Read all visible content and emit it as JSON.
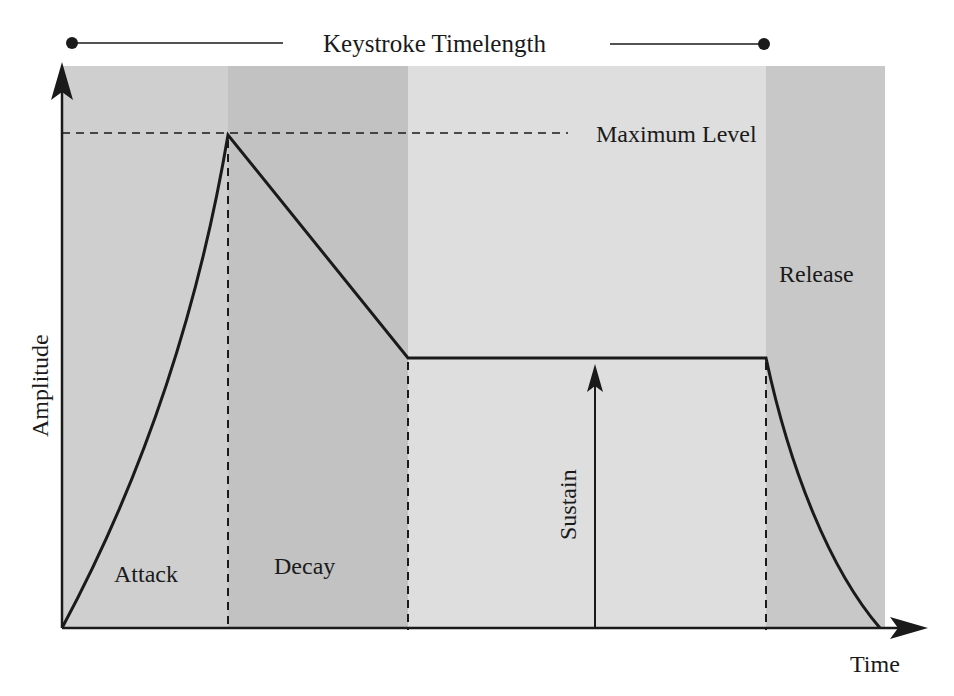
{
  "diagram": {
    "type": "ADSR envelope",
    "title": "Keystroke Timelength",
    "axes": {
      "x_label": "Time",
      "y_label": "Amplitude"
    },
    "annotations": {
      "max_level": "Maximum Level",
      "sustain": "Sustain"
    },
    "phases": [
      {
        "name": "Attack",
        "label": "Attack",
        "shade": "#cfcfcf"
      },
      {
        "name": "Decay",
        "label": "Decay",
        "shade": "#c2c2c2"
      },
      {
        "name": "Sustain",
        "label": "Sustain",
        "shade": "#dedede"
      },
      {
        "name": "Release",
        "label": "Release",
        "shade": "#c8c8c8"
      }
    ],
    "colors": {
      "line": "#1a1a1a",
      "background": "#ffffff"
    }
  }
}
